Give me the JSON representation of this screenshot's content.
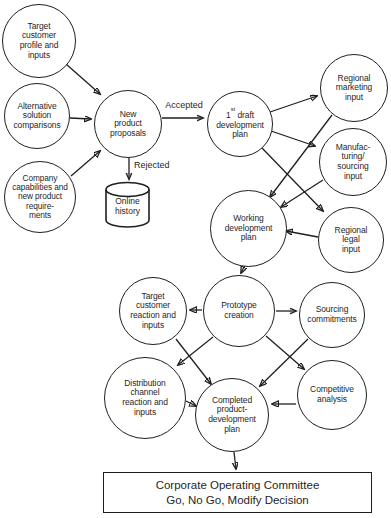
{
  "diagram": {
    "background": "#ffffff",
    "ink": "#1f1f1f",
    "type": "new-product-development-flowchart"
  },
  "nodes": {
    "target_profile": {
      "lines": [
        "Target",
        "customer",
        "profile and",
        "inputs"
      ]
    },
    "alternative_solutions": {
      "lines": [
        "Alternative",
        "solution",
        "comparisons"
      ]
    },
    "company_capabilities": {
      "lines": [
        "Company",
        "capabilities and",
        "new product",
        "require-",
        "ments"
      ]
    },
    "new_product_proposals": {
      "lines": [
        "New",
        "product",
        "proposals"
      ]
    },
    "online_history": {
      "lines": [
        "Online",
        "history"
      ]
    },
    "first_draft_plan": {
      "num": "1",
      "sup": "st",
      "rest": "draft",
      "lines": [
        "development",
        "plan"
      ]
    },
    "regional_marketing": {
      "lines": [
        "Regional",
        "marketing",
        "input"
      ]
    },
    "manufacturing_sourcing": {
      "lines": [
        "Manufac-",
        "turing/",
        "sourcing",
        "input"
      ]
    },
    "regional_legal": {
      "lines": [
        "Regional",
        "legal",
        "input"
      ]
    },
    "working_dev_plan": {
      "lines": [
        "Working",
        "development",
        "plan"
      ]
    },
    "prototype_creation": {
      "lines": [
        "Prototype",
        "creation"
      ]
    },
    "target_reaction": {
      "lines": [
        "Target",
        "customer",
        "reaction and",
        "inputs"
      ]
    },
    "sourcing_commitments": {
      "lines": [
        "Sourcing",
        "commitments"
      ]
    },
    "distribution_channel": {
      "lines": [
        "Distribution",
        "channel",
        "reaction and",
        "inputs"
      ]
    },
    "competitive_analysis": {
      "lines": [
        "Competitive",
        "analysis"
      ]
    },
    "completed_plan": {
      "lines": [
        "Completed",
        "product-",
        "development",
        "plan"
      ]
    },
    "committee": {
      "lines": [
        "Corporate Operating Committee",
        "Go, No Go, Modify Decision"
      ]
    }
  },
  "edge_labels": {
    "accepted": "Accepted",
    "rejected": "Rejected"
  },
  "edges": [
    {
      "from": "target_profile",
      "to": "new_product_proposals"
    },
    {
      "from": "alternative_solutions",
      "to": "new_product_proposals"
    },
    {
      "from": "company_capabilities",
      "to": "new_product_proposals"
    },
    {
      "from": "new_product_proposals",
      "to": "first_draft_plan",
      "label": "Accepted"
    },
    {
      "from": "new_product_proposals",
      "to": "online_history",
      "label": "Rejected"
    },
    {
      "from": "first_draft_plan",
      "to": "regional_marketing"
    },
    {
      "from": "first_draft_plan",
      "to": "manufacturing_sourcing"
    },
    {
      "from": "first_draft_plan",
      "to": "regional_legal"
    },
    {
      "from": "regional_marketing",
      "to": "working_dev_plan"
    },
    {
      "from": "manufacturing_sourcing",
      "to": "working_dev_plan"
    },
    {
      "from": "regional_legal",
      "to": "working_dev_plan"
    },
    {
      "from": "working_dev_plan",
      "to": "prototype_creation"
    },
    {
      "from": "prototype_creation",
      "to": "target_reaction"
    },
    {
      "from": "prototype_creation",
      "to": "sourcing_commitments"
    },
    {
      "from": "prototype_creation",
      "to": "distribution_channel"
    },
    {
      "from": "prototype_creation",
      "to": "competitive_analysis"
    },
    {
      "from": "target_reaction",
      "to": "completed_plan"
    },
    {
      "from": "sourcing_commitments",
      "to": "completed_plan"
    },
    {
      "from": "distribution_channel",
      "to": "completed_plan"
    },
    {
      "from": "competitive_analysis",
      "to": "completed_plan"
    },
    {
      "from": "completed_plan",
      "to": "committee"
    }
  ]
}
